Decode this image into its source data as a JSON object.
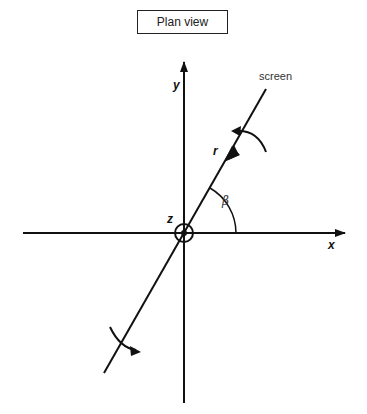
{
  "title": "Plan view",
  "labels": {
    "y_axis": "y",
    "x_axis": "x",
    "z_axis": "z",
    "radius": "r",
    "angle": "β",
    "screen": "screen"
  },
  "colors": {
    "stroke": "#111111",
    "background": "#ffffff"
  },
  "geometry": {
    "origin": [
      184,
      233
    ],
    "screen_angle_deg": 60,
    "rotation_arrows": 2
  }
}
